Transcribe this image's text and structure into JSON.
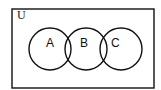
{
  "diagram": {
    "type": "venn",
    "universe": {
      "label": "U",
      "x": 12,
      "y": 9,
      "width": 142,
      "height": 79
    },
    "sets": [
      {
        "label": "A",
        "cx": 50,
        "cy": 49,
        "r": 21,
        "label_x": 50,
        "label_y": 47
      },
      {
        "label": "B",
        "cx": 86,
        "cy": 49,
        "r": 21,
        "label_x": 84,
        "label_y": 47
      },
      {
        "label": "C",
        "cx": 121,
        "cy": 49,
        "r": 21,
        "label_x": 115,
        "label_y": 47
      }
    ],
    "stroke_color": "#111111",
    "background_color": "#ffffff"
  }
}
